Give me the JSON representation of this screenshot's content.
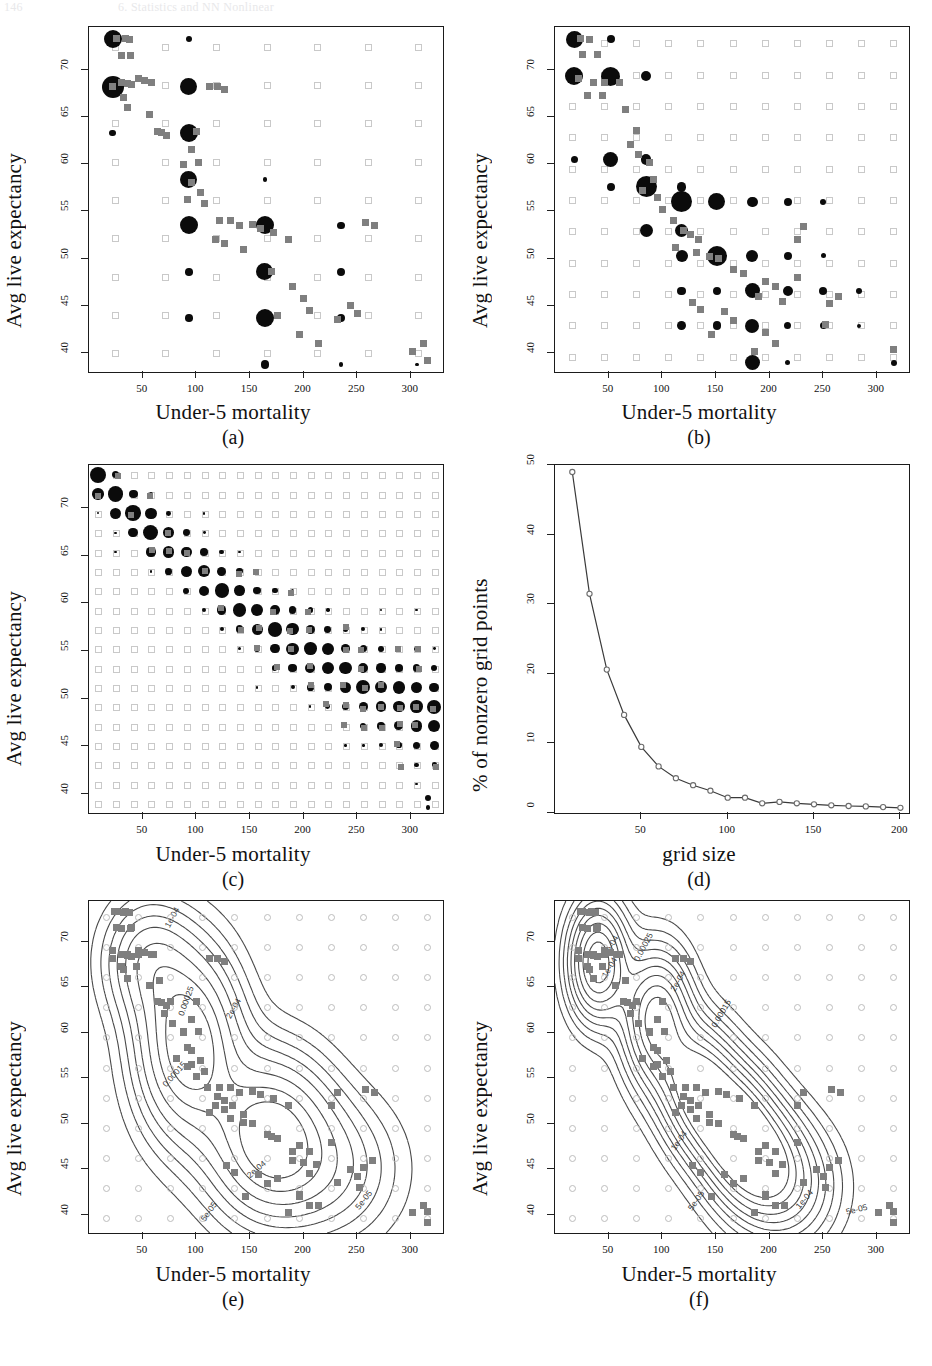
{
  "runhead": {
    "page": "146",
    "title": "6. Statistics and NN Nonlinear"
  },
  "axis": {
    "xlabel": "Under-5 mortality",
    "ylabel": "Avg live expectancy",
    "xticks": [
      50,
      100,
      150,
      200,
      250,
      300
    ],
    "yticks": [
      40,
      45,
      50,
      55,
      60,
      65,
      70
    ],
    "xlim": [
      0,
      330
    ],
    "ylim": [
      38,
      74.5
    ]
  },
  "panels": [
    {
      "id": "a",
      "caption": "(a)",
      "kind": "bubble-grid",
      "grid": {
        "nx": 7,
        "ny": 9
      }
    },
    {
      "id": "b",
      "caption": "(b)",
      "kind": "bubble-grid",
      "grid": {
        "nx": 11,
        "ny": 11
      }
    },
    {
      "id": "c",
      "caption": "(c)",
      "kind": "bubble-grid",
      "grid": {
        "nx": 20,
        "ny": 18
      }
    },
    {
      "id": "d",
      "caption": "(d)",
      "kind": "line"
    },
    {
      "id": "e",
      "caption": "(e)",
      "kind": "contour"
    },
    {
      "id": "f",
      "caption": "(f)",
      "kind": "contour"
    }
  ],
  "chart_data": [
    {
      "panel": "a",
      "type": "scatter",
      "title": "",
      "xlabel": "Under-5 mortality",
      "ylabel": "Avg live expectancy",
      "xlim": [
        0,
        330
      ],
      "ylim": [
        38,
        74.5
      ],
      "xticks": [
        50,
        100,
        150,
        200,
        250,
        300
      ],
      "yticks": [
        40,
        45,
        50,
        55,
        60,
        65,
        70
      ],
      "grid": "coarse 7 x 9 lattice",
      "legend": "none",
      "series": [
        {
          "name": "grid cells (black circles, area = count)",
          "points": [
            [
              22,
              73.2,
              9
            ],
            [
              22,
              68.2,
              11
            ],
            [
              22,
              63.3,
              3.2
            ],
            [
              93,
              73.2,
              3.2
            ],
            [
              93,
              68.2,
              8.5
            ],
            [
              93,
              63.3,
              9
            ],
            [
              93,
              58.4,
              8.5
            ],
            [
              93,
              53.5,
              9
            ],
            [
              93,
              48.6,
              3.8
            ],
            [
              93,
              43.7,
              3.8
            ],
            [
              164,
              68.2,
              0.0
            ],
            [
              164,
              58.4,
              2.4
            ],
            [
              164,
              53.5,
              9
            ],
            [
              164,
              48.6,
              8.5
            ],
            [
              164,
              43.7,
              9
            ],
            [
              164,
              38.8,
              4.2
            ],
            [
              235,
              53.5,
              3.8
            ],
            [
              235,
              48.6,
              4.2
            ],
            [
              235,
              43.7,
              4.2
            ],
            [
              235,
              38.8,
              2.4
            ],
            [
              306,
              38.8,
              1.8
            ]
          ]
        },
        {
          "name": "data observations (gray squares)",
          "points": [
            [
              26,
              73.3
            ],
            [
              34,
              73.3
            ],
            [
              38,
              73.2
            ],
            [
              30,
              71.5
            ],
            [
              39,
              71.5
            ],
            [
              30,
              68.6
            ],
            [
              36,
              68.5
            ],
            [
              40,
              68.4
            ],
            [
              22,
              68.2
            ],
            [
              32,
              67.0
            ],
            [
              36,
              66.0
            ],
            [
              46,
              69.1
            ],
            [
              52,
              68.8
            ],
            [
              58,
              68.6
            ],
            [
              56,
              65.2
            ],
            [
              64,
              63.4
            ],
            [
              68,
              63.3
            ],
            [
              72,
              63.0
            ],
            [
              100,
              63.4
            ],
            [
              96,
              61.5
            ],
            [
              102,
              60.2
            ],
            [
              88,
              60.0
            ],
            [
              112,
              68.2
            ],
            [
              120,
              68.2
            ],
            [
              126,
              67.9
            ],
            [
              96,
              58.1
            ],
            [
              104,
              57.0
            ],
            [
              92,
              56.3
            ],
            [
              108,
              55.8
            ],
            [
              122,
              54.0
            ],
            [
              132,
              54.0
            ],
            [
              140,
              53.5
            ],
            [
              152,
              53.6
            ],
            [
              118,
              52.0
            ],
            [
              126,
              51.6
            ],
            [
              144,
              51.0
            ],
            [
              160,
              53.2
            ],
            [
              172,
              52.8
            ],
            [
              186,
              52.0
            ],
            [
              170,
              48.6
            ],
            [
              190,
              47.0
            ],
            [
              200,
              45.8
            ],
            [
              206,
              44.5
            ],
            [
              176,
              44.0
            ],
            [
              196,
              42.0
            ],
            [
              214,
              41.0
            ],
            [
              232,
              43.6
            ],
            [
              244,
              45.0
            ],
            [
              250,
              44.2
            ],
            [
              258,
              53.8
            ],
            [
              266,
              53.5
            ],
            [
              302,
              40.2
            ],
            [
              316,
              39.2
            ],
            [
              312,
              41.0
            ]
          ]
        }
      ]
    },
    {
      "panel": "b",
      "type": "scatter",
      "xlabel": "Under-5 mortality",
      "ylabel": "Avg live expectancy",
      "xlim": [
        0,
        330
      ],
      "ylim": [
        38,
        74.5
      ],
      "grid": "medium 11 x 11 lattice",
      "series": [
        {
          "name": "grid cells (black circles, area = count)",
          "points": [
            [
              18,
              73.2,
              8.5
            ],
            [
              52,
              73.2,
              4.2
            ],
            [
              18,
              69.3,
              9.0
            ],
            [
              52,
              69.3,
              9.5
            ],
            [
              85,
              69.3,
              5.0
            ],
            [
              18,
              60.5,
              3.8
            ],
            [
              52,
              60.5,
              7.5
            ],
            [
              85,
              60.5,
              5.2
            ],
            [
              52,
              57.6,
              4.2
            ],
            [
              85,
              57.6,
              10.5
            ],
            [
              118,
              57.6,
              4.8
            ],
            [
              85,
              53.0,
              6.5
            ],
            [
              118,
              53.0,
              6.5
            ],
            [
              85,
              56.0,
              0
            ],
            [
              118,
              56.0,
              10.5
            ],
            [
              151,
              56.0,
              8.5
            ],
            [
              184,
              56.0,
              5.2
            ],
            [
              217,
              56.0,
              4.2
            ],
            [
              250,
              56.0,
              3.2
            ],
            [
              118,
              50.3,
              6.0
            ],
            [
              151,
              50.3,
              10.0
            ],
            [
              184,
              50.3,
              6.0
            ],
            [
              217,
              50.3,
              4.2
            ],
            [
              250,
              50.3,
              2.6
            ],
            [
              118,
              46.6,
              4.2
            ],
            [
              151,
              46.6,
              4.0
            ],
            [
              184,
              46.6,
              7.5
            ],
            [
              217,
              46.6,
              5.0
            ],
            [
              250,
              46.6,
              4.0
            ],
            [
              283,
              46.6,
              3.0
            ],
            [
              118,
              42.9,
              4.4
            ],
            [
              151,
              42.9,
              4.4
            ],
            [
              184,
              42.9,
              7.0
            ],
            [
              217,
              42.9,
              3.6
            ],
            [
              250,
              42.9,
              3.6
            ],
            [
              283,
              42.9,
              2.0
            ],
            [
              184,
              39.0,
              7.5
            ],
            [
              217,
              39.0,
              2.6
            ],
            [
              316,
              39.0,
              3.0
            ]
          ]
        },
        {
          "name": "data observations (gray squares)",
          "points": [
            [
              24,
              73.3
            ],
            [
              32,
              73.2
            ],
            [
              26,
              71.6
            ],
            [
              40,
              71.6
            ],
            [
              22,
              69.1
            ],
            [
              36,
              68.6
            ],
            [
              46,
              68.6
            ],
            [
              60,
              68.6
            ],
            [
              30,
              67.3
            ],
            [
              44,
              67.3
            ],
            [
              66,
              65.8
            ],
            [
              76,
              63.5
            ],
            [
              70,
              62.1
            ],
            [
              78,
              61.0
            ],
            [
              88,
              60.2
            ],
            [
              92,
              58.4
            ],
            [
              82,
              57.2
            ],
            [
              96,
              56.5
            ],
            [
              100,
              55.2
            ],
            [
              110,
              54.0
            ],
            [
              120,
              53.0
            ],
            [
              126,
              52.6
            ],
            [
              134,
              52.0
            ],
            [
              112,
              51.2
            ],
            [
              132,
              50.6
            ],
            [
              144,
              50.2
            ],
            [
              152,
              50.0
            ],
            [
              166,
              48.8
            ],
            [
              176,
              48.4
            ],
            [
              196,
              47.6
            ],
            [
              206,
              47.0
            ],
            [
              212,
              45.5
            ],
            [
              190,
              46.0
            ],
            [
              128,
              45.4
            ],
            [
              136,
              44.6
            ],
            [
              146,
              42.0
            ],
            [
              158,
              44.4
            ],
            [
              166,
              43.4
            ],
            [
              196,
              42.2
            ],
            [
              206,
              41.0
            ],
            [
              186,
              40.2
            ],
            [
              226,
              52.0
            ],
            [
              232,
              53.4
            ],
            [
              226,
              48.0
            ],
            [
              256,
              45.2
            ],
            [
              264,
              46.0
            ],
            [
              252,
              43.0
            ],
            [
              316,
              40.4
            ]
          ]
        }
      ]
    },
    {
      "panel": "c",
      "type": "scatter",
      "xlabel": "Under-5 mortality",
      "ylabel": "Avg live expectancy",
      "xlim": [
        0,
        330
      ],
      "ylim": [
        38,
        74.5
      ],
      "grid": "fine 20 x 18 lattice, mostly empty open squares",
      "note": "dense lattice; nonzero cells concentrated along the decreasing diagonal"
    },
    {
      "panel": "d",
      "type": "line",
      "title": "",
      "xlabel": "grid size",
      "ylabel": "% of nonzero grid points",
      "xlim": [
        0,
        205
      ],
      "ylim": [
        0,
        50
      ],
      "xticks": [
        50,
        100,
        150,
        200
      ],
      "yticks": [
        0,
        10,
        20,
        30,
        40,
        50
      ],
      "grid": false,
      "legend": "none",
      "x": [
        10,
        20,
        30,
        40,
        50,
        60,
        70,
        80,
        90,
        100,
        110,
        120,
        130,
        140,
        150,
        160,
        170,
        180,
        190,
        200
      ],
      "values": [
        49.0,
        31.5,
        20.6,
        14.1,
        9.5,
        6.7,
        5.0,
        4.0,
        3.2,
        2.2,
        2.2,
        1.4,
        1.6,
        1.4,
        1.25,
        1.1,
        1.0,
        0.95,
        0.85,
        0.75
      ]
    },
    {
      "panel": "e",
      "type": "contour",
      "xlabel": "Under-5 mortality",
      "ylabel": "Avg live expectancy",
      "xlim": [
        0,
        330
      ],
      "ylim": [
        38,
        74.5
      ],
      "contour_labels": [
        "1e-04",
        "2e-04",
        "0.00025",
        "0.00015",
        "5e-05"
      ],
      "modes": [
        [
          93,
          58.8
        ],
        [
          168,
          48.6
        ]
      ],
      "note": "two clear density modes; smoother/broader kernel"
    },
    {
      "panel": "f",
      "type": "contour",
      "xlabel": "Under-5 mortality",
      "ylabel": "Avg live expectancy",
      "xlim": [
        0,
        330
      ],
      "ylim": [
        38,
        74.5
      ],
      "contour_labels": [
        "1e-04",
        "2e-04",
        "0.00025",
        "0.00015",
        "5e-05",
        "5e-04"
      ],
      "modes": [
        [
          40,
          67.5
        ],
        [
          95,
          61.5
        ],
        [
          130,
          54.5
        ],
        [
          160,
          50.5
        ],
        [
          185,
          46.5
        ]
      ],
      "note": "narrow elongated ridge along the diagonal; several small nested modes"
    }
  ]
}
